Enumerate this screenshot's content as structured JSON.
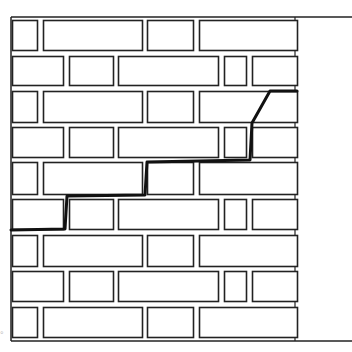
{
  "diagram": {
    "colors": {
      "background": "#ffffff",
      "line": "#222222",
      "crack": "#111111"
    },
    "canvas": {
      "width": 352,
      "height": 352
    },
    "wall": {
      "left": 11,
      "right": 297,
      "top": 17,
      "bottom": 341,
      "boundary_extends_to": 352
    },
    "rows": [
      {
        "y": 20,
        "h": 30,
        "pattern": "A"
      },
      {
        "y": 56,
        "h": 29,
        "pattern": "B"
      },
      {
        "y": 91,
        "h": 31,
        "pattern": "A"
      },
      {
        "y": 127,
        "h": 30,
        "pattern": "B"
      },
      {
        "y": 162,
        "h": 32,
        "pattern": "A"
      },
      {
        "y": 199,
        "h": 30,
        "pattern": "B"
      },
      {
        "y": 235,
        "h": 31,
        "pattern": "A"
      },
      {
        "y": 271,
        "h": 30,
        "pattern": "B"
      },
      {
        "y": 307,
        "h": 30,
        "pattern": "A"
      }
    ],
    "patterns": {
      "A": [
        [
          12,
          37
        ],
        [
          43,
          142
        ],
        [
          147,
          193
        ],
        [
          199,
          297
        ]
      ],
      "B": [
        [
          12,
          63
        ],
        [
          69,
          113
        ],
        [
          118,
          218
        ],
        [
          224,
          246
        ],
        [
          252,
          297
        ]
      ]
    },
    "crack": {
      "label": "stepped crack",
      "points": [
        [
          11,
          230
        ],
        [
          65,
          229
        ],
        [
          67,
          196
        ],
        [
          145,
          195
        ],
        [
          147,
          162
        ],
        [
          250,
          160
        ],
        [
          252,
          123
        ],
        [
          270,
          91
        ],
        [
          297,
          91
        ]
      ]
    },
    "corner_mark": "°"
  }
}
